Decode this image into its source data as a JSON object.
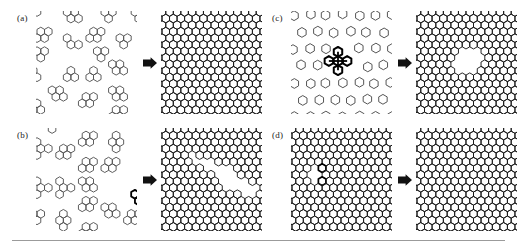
{
  "figure": {
    "width": 520,
    "height": 251,
    "background": "#ffffff",
    "rule_color": "#9b9b9b",
    "ink_color": "#1a1a1a",
    "mid_ink_color": "#555555"
  },
  "panels": [
    {
      "id": "a",
      "label": "(a)",
      "label_x": 17,
      "label_y": 14,
      "before": {
        "name": "disordered-hexagon-clusters",
        "x": 36,
        "y": 11,
        "w": 101,
        "h": 103,
        "description": "Randomly scattered small clusters of three to four hexagons with cut-off partial hexagons at the edges"
      },
      "arrow": {
        "x": 142,
        "y": 55,
        "w": 16,
        "h": 16,
        "glyph": "right-arrow"
      },
      "after": {
        "name": "perfect-honeycomb-lattice",
        "x": 161,
        "y": 11,
        "w": 101,
        "h": 103,
        "description": "Fully ordered defect-free honeycomb lattice"
      }
    },
    {
      "id": "b",
      "label": "(b)",
      "label_x": 17,
      "label_y": 131,
      "before": {
        "name": "rhombic-tetramer-clusters",
        "x": 36,
        "y": 128,
        "w": 101,
        "h": 103,
        "description": "Randomly scattered four-hexagon rhombic clusters, one cluster drawn in bold near the centre"
      },
      "arrow": {
        "x": 142,
        "y": 172,
        "w": 16,
        "h": 16,
        "glyph": "right-arrow"
      },
      "after": {
        "name": "honeycomb-with-grain-boundary",
        "x": 161,
        "y": 128,
        "w": 101,
        "h": 103,
        "description": "Honeycomb lattice containing an irregular grain-boundary crack defect"
      }
    },
    {
      "id": "c",
      "label": "(c)",
      "label_x": 272,
      "label_y": 14,
      "before": {
        "name": "isolated-hexagon-monomers",
        "x": 291,
        "y": 11,
        "w": 101,
        "h": 103,
        "description": "Widely separated single hexagons with one bold cross-shaped five-hexagon cluster"
      },
      "arrow": {
        "x": 397,
        "y": 55,
        "w": 16,
        "h": 16,
        "glyph": "right-arrow"
      },
      "after": {
        "name": "honeycomb-with-hexagonal-void",
        "x": 416,
        "y": 11,
        "w": 101,
        "h": 103,
        "description": "Honeycomb lattice containing a large hexagonal pore in the centre"
      }
    },
    {
      "id": "d",
      "label": "(d)",
      "label_x": 272,
      "label_y": 131,
      "before": {
        "name": "honeycomb-with-vacancy-defect",
        "x": 291,
        "y": 128,
        "w": 101,
        "h": 103,
        "description": "Nearly complete honeycomb lattice with a small vacancy defect marked in bold"
      },
      "arrow": {
        "x": 397,
        "y": 172,
        "w": 16,
        "h": 16,
        "glyph": "right-arrow"
      },
      "after": {
        "name": "perfect-honeycomb-lattice",
        "x": 416,
        "y": 128,
        "w": 101,
        "h": 103,
        "description": "Fully ordered defect-free honeycomb lattice"
      }
    }
  ],
  "rule": {
    "x": 12,
    "y": 240,
    "w": 493,
    "h": 1
  }
}
